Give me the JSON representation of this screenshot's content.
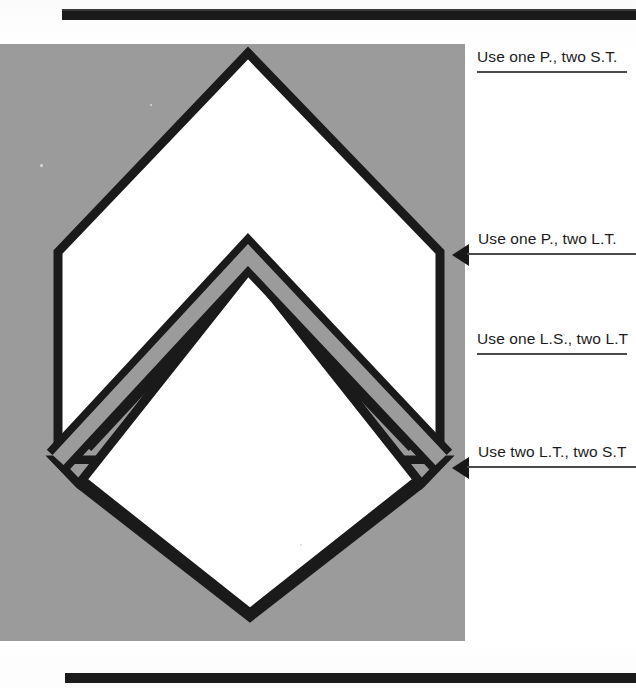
{
  "header": {
    "rule": "black-bar"
  },
  "footer": {
    "rule": "black-bar"
  },
  "artwork": {
    "panel_color": "#9b9b9b",
    "outline_color": "#1a1a1a",
    "fill_color": "#ffffff",
    "band_color": "#9b9b9b",
    "description": "chevron-and-diamond insignia assembly"
  },
  "callouts": [
    {
      "id": "callout-1",
      "text": "Use one P., two S.T.",
      "has_arrow": false
    },
    {
      "id": "callout-2",
      "text": "Use one P., two L.T.",
      "has_arrow": true
    },
    {
      "id": "callout-3",
      "text": "Use one L.S., two L.T",
      "has_arrow": false
    },
    {
      "id": "callout-4",
      "text": "Use two L.T., two S.T",
      "has_arrow": true
    }
  ]
}
